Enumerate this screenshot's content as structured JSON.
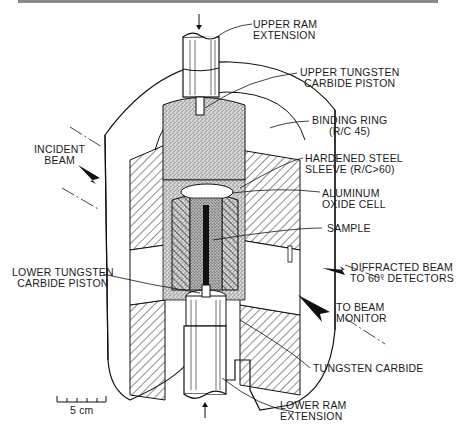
{
  "figure": {
    "labels": {
      "upper_ram_extension": [
        "UPPER RAM",
        "EXTENSION"
      ],
      "upper_tungsten_carbide_piston": [
        "UPPER TUNGSTEN",
        "CARBIDE PISTON"
      ],
      "binding_ring": [
        "BINDING RING",
        "(R/C 45)"
      ],
      "incident_beam": [
        "INCIDENT",
        "BEAM"
      ],
      "hardened_steel_sleeve": [
        "HARDENED STEEL",
        "SLEEVE (R/C>60)"
      ],
      "aluminum_oxide_cell": [
        "ALUMINUM",
        "OXIDE CELL"
      ],
      "sample": [
        "SAMPLE"
      ],
      "diffracted_beam": [
        "DIFFRACTED BEAM",
        "TO 60° DETECTORS"
      ],
      "lower_tungsten_carbide_piston": [
        "LOWER TUNGSTEN",
        "CARBIDE PISTON"
      ],
      "to_beam_monitor": [
        "TO BEAM",
        "MONITOR"
      ],
      "tungsten_carbide": [
        "TUNGSTEN CARBIDE"
      ],
      "lower_ram_extension": [
        "LOWER RAM",
        "EXTENSION"
      ]
    },
    "scale_bar": {
      "label": "5 cm",
      "ticks": 6
    }
  }
}
